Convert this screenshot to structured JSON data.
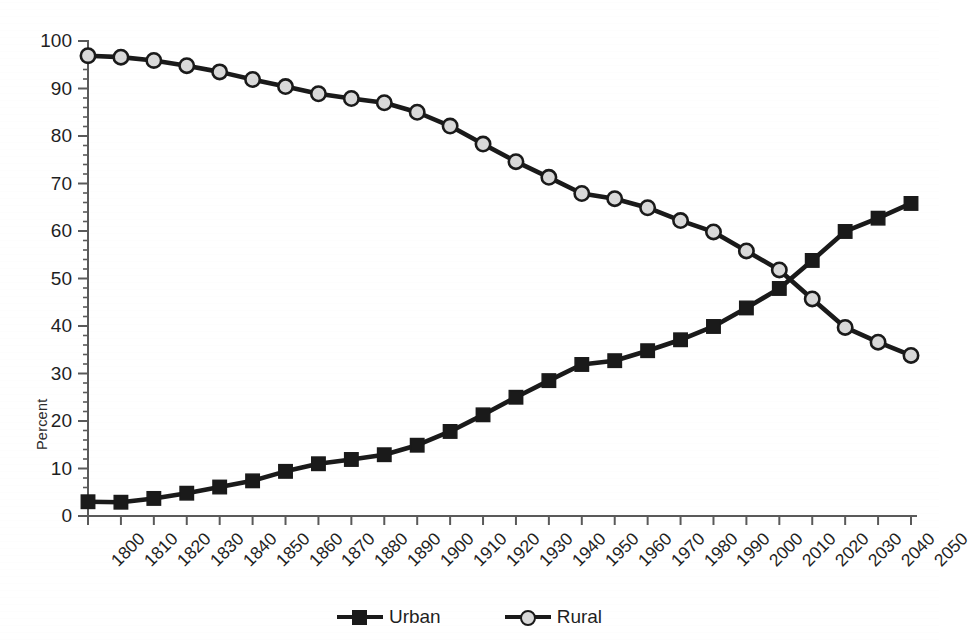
{
  "chart_data": {
    "type": "line",
    "title": "",
    "xlabel": "",
    "ylabel": "Percent",
    "ylim": [
      0,
      100
    ],
    "xlim": [
      1800,
      2050
    ],
    "ytick_step": 10,
    "yminor_step": 2,
    "grid": false,
    "legend_position": "bottom",
    "x": [
      1800,
      1810,
      1820,
      1830,
      1840,
      1850,
      1860,
      1870,
      1880,
      1890,
      1900,
      1910,
      1920,
      1930,
      1940,
      1950,
      1960,
      1970,
      1980,
      1990,
      2000,
      2010,
      2020,
      2030,
      2040,
      2050
    ],
    "categories": [
      "1800",
      "1810",
      "1820",
      "1830",
      "1840",
      "1850",
      "1860",
      "1870",
      "1880",
      "1890",
      "1900",
      "1910",
      "1920",
      "1930",
      "1940",
      "1950",
      "1960",
      "1970",
      "1980",
      "1990",
      "2000",
      "2010",
      "2020",
      "2030",
      "2040",
      "2050"
    ],
    "ytick_labels": [
      "0",
      "10",
      "20",
      "30",
      "40",
      "50",
      "60",
      "70",
      "80",
      "90",
      "100"
    ],
    "ytick_values": [
      0,
      10,
      20,
      30,
      40,
      50,
      60,
      70,
      80,
      90,
      100
    ],
    "series": [
      {
        "name": "Urban",
        "marker": "square",
        "marker_fill": "#1a1a1a",
        "marker_edge": "#1a1a1a",
        "line_color": "#1a1a1a",
        "values": [
          3.0,
          2.9,
          3.7,
          4.8,
          6.1,
          7.4,
          9.4,
          11.0,
          11.9,
          12.9,
          14.9,
          17.8,
          21.3,
          25.0,
          28.5,
          31.9,
          32.7,
          34.8,
          37.1,
          39.9,
          43.8,
          47.9,
          53.8,
          59.9,
          62.7,
          65.8
        ]
      },
      {
        "name": "Rural",
        "marker": "circle",
        "marker_fill": "#d9d9d9",
        "marker_edge": "#1a1a1a",
        "line_color": "#1a1a1a",
        "values": [
          96.9,
          96.6,
          95.9,
          94.8,
          93.5,
          91.9,
          90.4,
          88.9,
          87.9,
          87.0,
          85.0,
          82.1,
          78.3,
          74.6,
          71.3,
          67.9,
          66.8,
          64.9,
          62.2,
          59.8,
          55.8,
          51.8,
          45.7,
          39.7,
          36.6,
          33.8
        ]
      }
    ]
  },
  "legend": {
    "entries": [
      {
        "label": "Urban"
      },
      {
        "label": "Rural"
      }
    ]
  },
  "axes": {
    "y_title": "Percent"
  }
}
